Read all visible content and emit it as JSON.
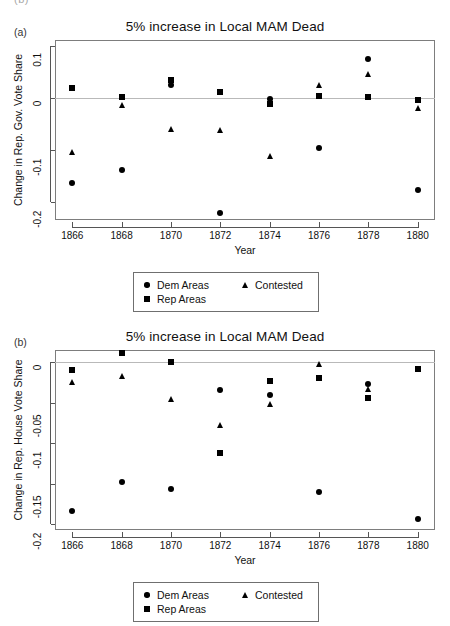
{
  "page": {
    "cutoff_text": "(b)"
  },
  "panels": [
    {
      "letter": "(a)",
      "title": "5% increase in Local MAM Dead",
      "xlabel": "Year",
      "ylabel": "Change in Rep. Gov. Vote Share",
      "legend": {
        "dem": "Dem Areas",
        "contested": "Contested",
        "rep": "Rep Areas"
      }
    },
    {
      "letter": "(b)",
      "title": "5% increase in Local MAM Dead",
      "xlabel": "Year",
      "ylabel": "Change in Rep. House Vote Share",
      "legend": {
        "dem": "Dem Areas",
        "contested": "Contested",
        "rep": "Rep Areas"
      }
    }
  ],
  "chart_data": [
    {
      "type": "scatter",
      "panel": "(a)",
      "title": "5% increase in Local MAM Dead",
      "xlabel": "Year",
      "ylabel": "Change in Rep. Gov. Vote Share",
      "x": [
        1866,
        1868,
        1870,
        1872,
        1874,
        1876,
        1878,
        1880
      ],
      "xticks": [
        "1866",
        "1868",
        "1870",
        "1872",
        "1874",
        "1876",
        "1878",
        "1880"
      ],
      "yticks": [
        0.1,
        0,
        -0.1,
        -0.2
      ],
      "ytick_labels": [
        "0.1",
        "0",
        "-0.1",
        "-0.2"
      ],
      "xlim": [
        1865.3,
        1880.7
      ],
      "ylim": [
        -0.235,
        0.112
      ],
      "grid": false,
      "zero_line": 0,
      "legend_position": "below",
      "series": [
        {
          "name": "Dem Areas",
          "marker": "circle",
          "values": [
            -0.163,
            -0.139,
            0.026,
            -0.222,
            -0.001,
            -0.096,
            0.075,
            -0.178
          ]
        },
        {
          "name": "Rep Areas",
          "marker": "square",
          "values": [
            0.02,
            0.003,
            0.035,
            0.011,
            -0.011,
            0.004,
            0.002,
            -0.004
          ]
        },
        {
          "name": "Contested",
          "marker": "triangle",
          "values": [
            -0.103,
            -0.013,
            -0.06,
            -0.061,
            -0.111,
            0.025,
            0.046,
            -0.02
          ]
        }
      ]
    },
    {
      "type": "scatter",
      "panel": "(b)",
      "title": "5% increase in Local MAM Dead",
      "xlabel": "Year",
      "ylabel": "Change in Rep. House Vote Share",
      "x": [
        1866,
        1868,
        1870,
        1872,
        1874,
        1876,
        1878,
        1880
      ],
      "xticks": [
        "1866",
        "1868",
        "1870",
        "1872",
        "1874",
        "1876",
        "1878",
        "1880"
      ],
      "yticks": [
        0,
        -0.05,
        -0.1,
        -0.15,
        -0.2
      ],
      "ytick_labels": [
        "0",
        "-0.05",
        "-0.1",
        "-0.15",
        "-0.2"
      ],
      "xlim": [
        1865.3,
        1880.7
      ],
      "ylim": [
        -0.207,
        0.015
      ],
      "grid": false,
      "zero_line": 0,
      "legend_position": "below",
      "series": [
        {
          "name": "Dem Areas",
          "marker": "circle",
          "values": [
            -0.183,
            -0.148,
            -0.157,
            -0.034,
            -0.04,
            -0.16,
            -0.027,
            -0.193
          ]
        },
        {
          "name": "Rep Areas",
          "marker": "square",
          "values": [
            -0.01,
            0.011,
            0.0,
            -0.112,
            -0.023,
            -0.02,
            -0.044,
            -0.008
          ]
        },
        {
          "name": "Contested",
          "marker": "triangle",
          "values": [
            -0.024,
            -0.017,
            -0.046,
            -0.078,
            -0.051,
            -0.002,
            -0.033,
            -0.008
          ]
        }
      ]
    }
  ]
}
